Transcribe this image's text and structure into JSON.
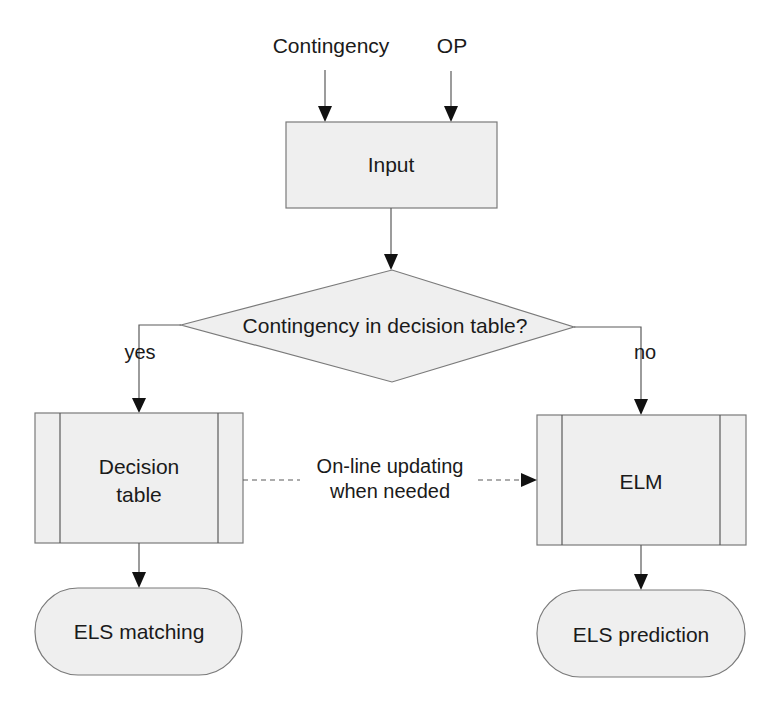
{
  "diagram": {
    "type": "flowchart",
    "inputs": [
      {
        "id": "contingency",
        "label": "Contingency"
      },
      {
        "id": "op",
        "label": "OP"
      }
    ],
    "nodes": {
      "input": {
        "shape": "process",
        "label": "Input"
      },
      "decision": {
        "shape": "decision",
        "label": "Contingency in decision table?"
      },
      "decision_table": {
        "shape": "predefined-process",
        "label_line1": "Decision",
        "label_line2": "table"
      },
      "elm": {
        "shape": "predefined-process",
        "label": "ELM"
      },
      "els_matching": {
        "shape": "terminator",
        "label": "ELS matching"
      },
      "els_prediction": {
        "shape": "terminator",
        "label": "ELS prediction"
      }
    },
    "edges": {
      "yes_label": "yes",
      "no_label": "no",
      "update_label_line1": "On-line updating",
      "update_label_line2": "when needed"
    },
    "colors": {
      "shape_fill": "#efefef",
      "shape_stroke": "#7a7a7a",
      "line": "#5a5a5a",
      "arrowhead": "#111111",
      "text": "#1a1a1a"
    }
  }
}
